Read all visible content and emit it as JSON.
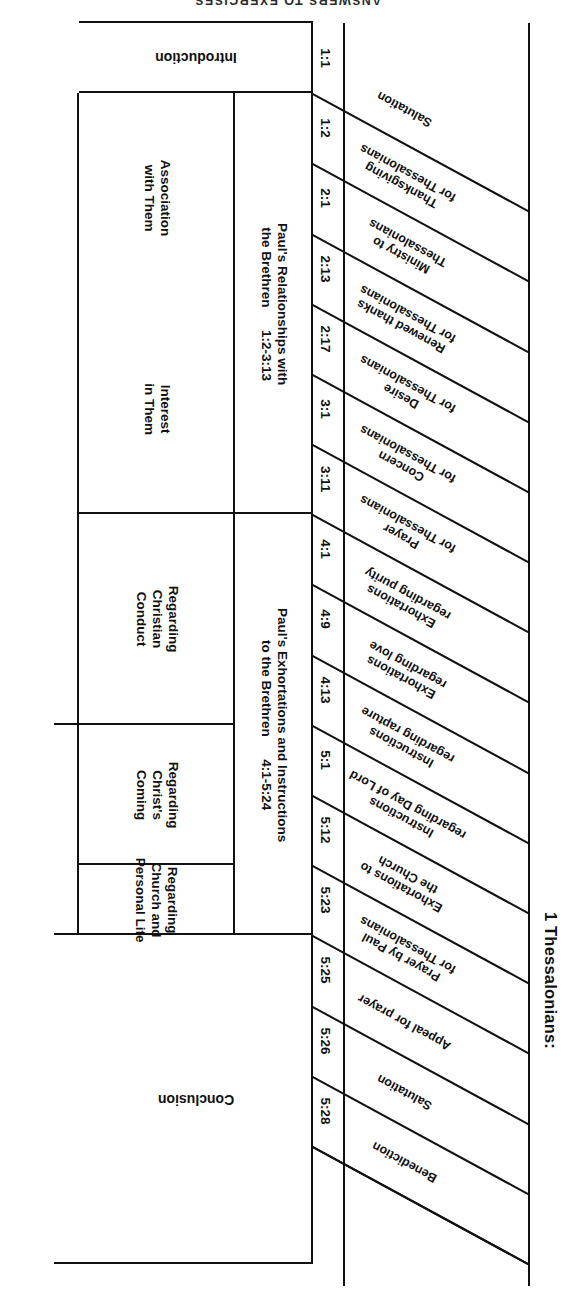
{
  "page": {
    "running_head": "ANSWERS TO EXERCISES"
  },
  "chart_data": {
    "type": "table",
    "title": "1 Thessalonians:",
    "orientation": "rotated-180",
    "columns": [
      "Section / Topic",
      "Reference",
      "Major Division",
      "Sub-Division",
      "Book Division"
    ],
    "topics": [
      {
        "label": "Salutation",
        "ref": "1:1"
      },
      {
        "label": "Thanksgiving\nfor Thessalonians",
        "ref": "1:2"
      },
      {
        "label": "Ministry to\nThessalonians",
        "ref": "2:1"
      },
      {
        "label": "Renewed thanks\nfor Thessalonians",
        "ref": "2:13"
      },
      {
        "label": "Desire\nfor Thessalonians",
        "ref": "2:17"
      },
      {
        "label": "Concern\nfor Thessalonians",
        "ref": "3:1"
      },
      {
        "label": "Prayer\nfor Thessalonians",
        "ref": "3:11"
      },
      {
        "label": "Exhortations\nregarding purity",
        "ref": "4:1"
      },
      {
        "label": "Exhortations\nregarding love",
        "ref": "4:9"
      },
      {
        "label": "Instructions\nregarding rapture",
        "ref": "4:13"
      },
      {
        "label": "Instructions\nregarding Day of Lord",
        "ref": "5:1"
      },
      {
        "label": "Exhortations to\nthe Church",
        "ref": "5:12"
      },
      {
        "label": "Prayer by Paul\nfor Thessalonians",
        "ref": "5:23"
      },
      {
        "label": "Appeal for prayer",
        "ref": "5:25"
      },
      {
        "label": "Salutation",
        "ref": "5:26"
      },
      {
        "label": "Benediction",
        "ref": "5:28"
      }
    ],
    "major_divisions": [
      {
        "label": "Paul's Relationships with\nthe Brethren      1:2-3:13"
      },
      {
        "label": "Paul's Exhortations and Instructions\nto the Brethren      4:1-5:24"
      }
    ],
    "sub_divisions": [
      {
        "label": "Association\nwith Them"
      },
      {
        "label": "Interest\nin Them"
      },
      {
        "label": "Regarding\nChristian\nConduct"
      },
      {
        "label": "Regarding\nChrist's\nComing"
      },
      {
        "label": "Regarding\nChurch and\nPersonal Life"
      }
    ],
    "book_divisions": [
      {
        "label": "Introduction"
      },
      {
        "label": "Conclusion"
      }
    ],
    "colors": {
      "ink": "#111111",
      "paper": "#ffffff"
    }
  }
}
